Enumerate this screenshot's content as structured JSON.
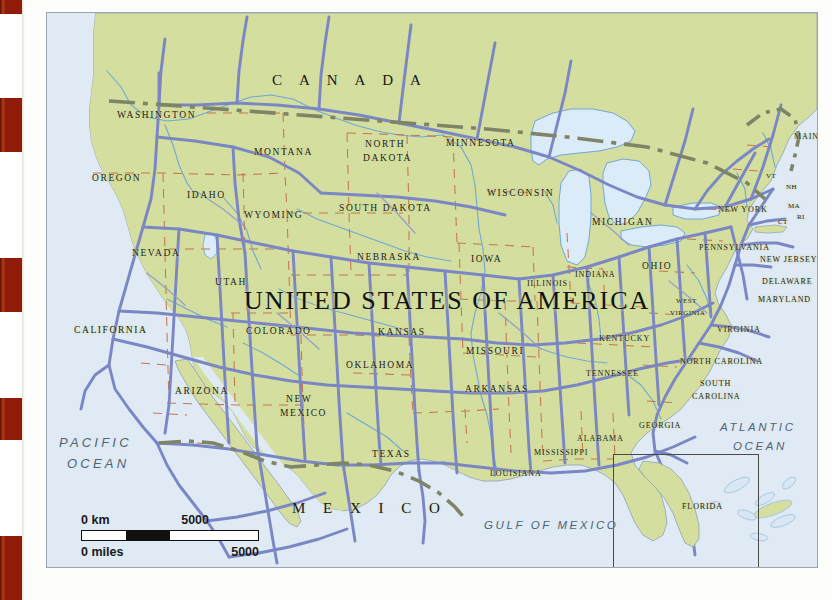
{
  "document": {
    "type": "atlas-map-page",
    "map_title": "UNITED STATES OF AMERICA"
  },
  "map": {
    "background_land_color": "#d4de9e",
    "background_ocean_color": "#dfeaf5",
    "road_color": "#7b86c4",
    "river_color": "#6fa8d8",
    "state_border_color": "#c8754a",
    "international_border_color": "#7e8466",
    "frame_color": "#9aa6ae"
  },
  "countries": [
    {
      "name": "C A N A D A",
      "x": 225,
      "y": 60,
      "class": "country"
    },
    {
      "name": "M E X I C O",
      "x": 245,
      "y": 488,
      "class": "country"
    }
  ],
  "map_title_label": {
    "text": "UNITED STATES OF AMERICA",
    "x": 197,
    "y": 275
  },
  "oceans": [
    {
      "name": "PACIFIC",
      "x": 12,
      "y": 423,
      "class": "ocean"
    },
    {
      "name": "OCEAN",
      "x": 20,
      "y": 444,
      "class": "ocean"
    },
    {
      "name": "ATLANTIC",
      "x": 673,
      "y": 409,
      "class": "ocean sm"
    },
    {
      "name": "OCEAN",
      "x": 686,
      "y": 428,
      "class": "ocean sm"
    },
    {
      "name": "GULF  OF  MEXICO",
      "x": 437,
      "y": 507,
      "class": "ocean sm"
    }
  ],
  "states": [
    {
      "name": "WASHINGTON",
      "x": 70,
      "y": 98,
      "class": "state"
    },
    {
      "name": "OREGON",
      "x": 45,
      "y": 161,
      "class": "state"
    },
    {
      "name": "IDAHO",
      "x": 140,
      "y": 178,
      "class": "state"
    },
    {
      "name": "MONTANA",
      "x": 207,
      "y": 135,
      "class": "state"
    },
    {
      "name": "NORTH",
      "x": 318,
      "y": 127,
      "class": "state"
    },
    {
      "name": "DAKOTA",
      "x": 316,
      "y": 141,
      "class": "state"
    },
    {
      "name": "SOUTH DAKOTA",
      "x": 292,
      "y": 191,
      "class": "state"
    },
    {
      "name": "WYOMING",
      "x": 197,
      "y": 198,
      "class": "state"
    },
    {
      "name": "NEBRASKA",
      "x": 310,
      "y": 240,
      "class": "state"
    },
    {
      "name": "NEVADA",
      "x": 85,
      "y": 236,
      "class": "state"
    },
    {
      "name": "UTAH",
      "x": 168,
      "y": 265,
      "class": "state"
    },
    {
      "name": "CALIFORNIA",
      "x": 27,
      "y": 313,
      "class": "state"
    },
    {
      "name": "COLORADO",
      "x": 199,
      "y": 314,
      "class": "state"
    },
    {
      "name": "ARIZONA",
      "x": 128,
      "y": 374,
      "class": "state"
    },
    {
      "name": "NEW",
      "x": 239,
      "y": 382,
      "class": "state"
    },
    {
      "name": "MEXICO",
      "x": 233,
      "y": 396,
      "class": "state"
    },
    {
      "name": "KANSAS",
      "x": 331,
      "y": 315,
      "class": "state"
    },
    {
      "name": "OKLAHOMA",
      "x": 299,
      "y": 348,
      "class": "state"
    },
    {
      "name": "TEXAS",
      "x": 325,
      "y": 437,
      "class": "state"
    },
    {
      "name": "MINNESOTA",
      "x": 399,
      "y": 126,
      "class": "state"
    },
    {
      "name": "WISCONSIN",
      "x": 440,
      "y": 176,
      "class": "state"
    },
    {
      "name": "IOWA",
      "x": 424,
      "y": 242,
      "class": "state"
    },
    {
      "name": "MISSOURI",
      "x": 419,
      "y": 334,
      "class": "state"
    },
    {
      "name": "ARKANSAS",
      "x": 418,
      "y": 372,
      "class": "state"
    },
    {
      "name": "LOUISIANA",
      "x": 443,
      "y": 457,
      "class": "state sm"
    },
    {
      "name": "MISSISSIPPI",
      "x": 487,
      "y": 436,
      "class": "state sm"
    },
    {
      "name": "ALABAMA",
      "x": 530,
      "y": 422,
      "class": "state sm"
    },
    {
      "name": "ILLINOIS",
      "x": 480,
      "y": 267,
      "class": "state sm"
    },
    {
      "name": "INDIANA",
      "x": 528,
      "y": 258,
      "class": "state sm"
    },
    {
      "name": "MICHIGAN",
      "x": 545,
      "y": 205,
      "class": "state"
    },
    {
      "name": "OHIO",
      "x": 595,
      "y": 249,
      "class": "state"
    },
    {
      "name": "KENTUCKY",
      "x": 552,
      "y": 322,
      "class": "state sm"
    },
    {
      "name": "TENNESSEE",
      "x": 539,
      "y": 357,
      "class": "state sm"
    },
    {
      "name": "GEORGIA",
      "x": 592,
      "y": 409,
      "class": "state sm"
    },
    {
      "name": "FLORIDA",
      "x": 635,
      "y": 490,
      "class": "state sm"
    },
    {
      "name": "SOUTH",
      "x": 653,
      "y": 367,
      "class": "state sm"
    },
    {
      "name": "CAROLINA",
      "x": 645,
      "y": 380,
      "class": "state sm"
    },
    {
      "name": "NORTH CAROLINA",
      "x": 633,
      "y": 345,
      "class": "state sm"
    },
    {
      "name": "VIRGINIA",
      "x": 670,
      "y": 313,
      "class": "state sm"
    },
    {
      "name": "WEST",
      "x": 629,
      "y": 285,
      "class": "state xs"
    },
    {
      "name": "VIRGINIA",
      "x": 623,
      "y": 297,
      "class": "state xs"
    },
    {
      "name": "PENNSYLVANIA",
      "x": 652,
      "y": 231,
      "class": "state sm"
    },
    {
      "name": "NEW YORK",
      "x": 671,
      "y": 193,
      "class": "state sm"
    },
    {
      "name": "NEW JERSEY",
      "x": 713,
      "y": 243,
      "class": "state sm"
    },
    {
      "name": "DELAWARE",
      "x": 715,
      "y": 265,
      "class": "state sm"
    },
    {
      "name": "MARYLAND",
      "x": 711,
      "y": 283,
      "class": "state sm"
    },
    {
      "name": "MAINE",
      "x": 747,
      "y": 120,
      "class": "state sm"
    },
    {
      "name": "VT",
      "x": 719,
      "y": 160,
      "class": "state xs"
    },
    {
      "name": "NH",
      "x": 739,
      "y": 171,
      "class": "state xs"
    },
    {
      "name": "MA",
      "x": 741,
      "y": 190,
      "class": "state xs"
    },
    {
      "name": "CT",
      "x": 731,
      "y": 206,
      "class": "state xs"
    },
    {
      "name": "RI",
      "x": 750,
      "y": 201,
      "class": "state xs"
    }
  ],
  "scale_bar": {
    "km_start": "0 km",
    "km_end": "5000",
    "miles_start": "0 miles",
    "miles_end": "5000"
  },
  "inset_box": {
    "x": 566,
    "y": 441,
    "width": 144,
    "height": 125
  }
}
